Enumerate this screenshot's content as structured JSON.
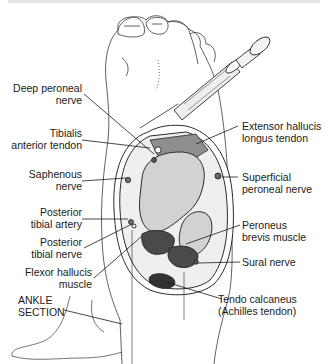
{
  "figure": {
    "section_label": [
      "ANKLE",
      "SECTION"
    ],
    "colors": {
      "line": "#2a2a2a",
      "bone": "#cfcfcf",
      "muscle_dark": "#4a4a4a",
      "tendon_shade": "#8a8a8a",
      "background": "#ffffff"
    }
  },
  "labels_left": [
    {
      "id": "deep-peroneal-nerve",
      "lines": [
        "Deep peroneal",
        "nerve"
      ]
    },
    {
      "id": "tibialis-anterior-tendon",
      "lines": [
        "Tibialis",
        "anterior tendon"
      ]
    },
    {
      "id": "saphenous-nerve",
      "lines": [
        "Saphenous",
        "nerve"
      ]
    },
    {
      "id": "posterior-tibial-artery",
      "lines": [
        "Posterior",
        "tibial artery"
      ]
    },
    {
      "id": "posterior-tibial-nerve",
      "lines": [
        "Posterior",
        "tibial nerve"
      ]
    },
    {
      "id": "flexor-hallucis-muscle",
      "lines": [
        "Flexor hallucis",
        "muscle"
      ]
    }
  ],
  "labels_right": [
    {
      "id": "extensor-hallucis-longus-tendon",
      "lines": [
        "Extensor hallucis",
        "longus tendon"
      ]
    },
    {
      "id": "superficial-peroneal-nerve",
      "lines": [
        "Superficial",
        "peroneal nerve"
      ]
    },
    {
      "id": "peroneus-brevis-muscle",
      "lines": [
        "Peroneus",
        "brevis muscle"
      ]
    },
    {
      "id": "sural-nerve",
      "lines": [
        "Sural nerve"
      ]
    },
    {
      "id": "tendo-calcaneus",
      "lines": [
        "Tendo calcaneus",
        "(Achilles tendon)"
      ]
    }
  ]
}
